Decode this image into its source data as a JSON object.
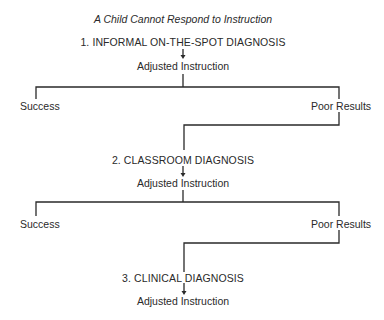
{
  "diagram": {
    "title": "A Child Cannot Respond to Instruction",
    "stages": [
      {
        "step": "1. INFORMAL ON-THE-SPOT DIAGNOSIS",
        "action": "Adjusted Instruction",
        "outcomes": {
          "left": "Success",
          "right": "Poor Results"
        }
      },
      {
        "step": "2. CLASSROOM DIAGNOSIS",
        "action": "Adjusted Instruction",
        "outcomes": {
          "left": "Success",
          "right": "Poor Results"
        }
      },
      {
        "step": "3. CLINICAL DIAGNOSIS",
        "action": "Adjusted Instruction"
      }
    ],
    "colors": {
      "line": "#2a2a2a",
      "text": "#2a2a2a",
      "background": "#ffffff"
    }
  }
}
